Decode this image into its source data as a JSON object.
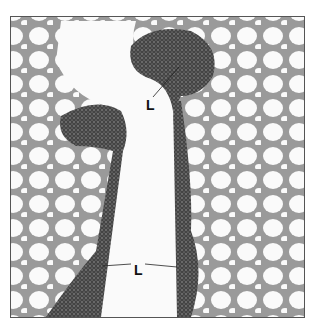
{
  "figure": {
    "type": "grayscale light micrograph",
    "labels": [
      {
        "id": "L1",
        "text": "L",
        "x": 145,
        "y": 103
      },
      {
        "id": "L2",
        "text": "L",
        "x": 133,
        "y": 268
      }
    ],
    "colors": {
      "background": "#ffffff",
      "tissue_dark": "#3a3a3a",
      "alveolar_wall": "#888888",
      "lumen": "#fafafa",
      "border": "#555555"
    }
  }
}
